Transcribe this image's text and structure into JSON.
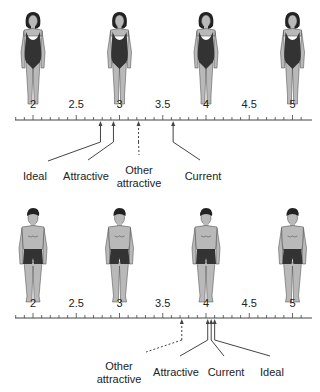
{
  "scale": {
    "min": 1.8,
    "max": 5.1,
    "major_labels": [
      "2",
      "2.5",
      "3",
      "3.5",
      "4",
      "4.5",
      "5"
    ],
    "major_values": [
      2,
      2.5,
      3,
      3.5,
      4,
      4.5,
      5
    ],
    "tick_step": 0.1,
    "px_at_2": 33,
    "px_per_unit": 86.5
  },
  "colors": {
    "skin": "#b9b9b9",
    "swimsuit": "#333333",
    "hair": "#222222",
    "line": "#444444",
    "text": "#222222"
  },
  "panels": [
    {
      "id": "women",
      "figure_type": "female",
      "figure_values": [
        2,
        3,
        4,
        5
      ],
      "axis_y": 120,
      "label_y": 108,
      "markers": [
        {
          "label_lines": [
            "Ideal"
          ],
          "value": 2.78,
          "dashed": false,
          "label_x": 35,
          "label_y": 172,
          "bend_x": 48,
          "bend_y": 163,
          "anchor": "middle"
        },
        {
          "label_lines": [
            "Attractive"
          ],
          "value": 2.93,
          "dashed": false,
          "label_x": 86,
          "label_y": 172,
          "bend_x": 88,
          "bend_y": 162,
          "anchor": "middle"
        },
        {
          "label_lines": [
            "Other",
            "attractive"
          ],
          "value": 3.22,
          "dashed": true,
          "label_x": 139,
          "label_y": 166,
          "bend_x": 139,
          "bend_y": 157,
          "anchor": "middle"
        },
        {
          "label_lines": [
            "Current"
          ],
          "value": 3.62,
          "dashed": false,
          "label_x": 203,
          "label_y": 172,
          "bend_x": 200,
          "bend_y": 162,
          "anchor": "middle"
        }
      ]
    },
    {
      "id": "men",
      "figure_type": "male",
      "figure_values": [
        2,
        3,
        4,
        5
      ],
      "axis_y": 122,
      "label_y": 111,
      "markers": [
        {
          "label_lines": [
            "Other",
            "attractive"
          ],
          "value": 3.72,
          "dashed": true,
          "label_x": 119,
          "label_y": 166,
          "bend_x": 146,
          "bend_y": 158,
          "anchor": "middle"
        },
        {
          "label_lines": [
            "Attractive"
          ],
          "value": 4.02,
          "dashed": false,
          "label_x": 176,
          "label_y": 172,
          "bend_x": 180,
          "bend_y": 162,
          "anchor": "middle"
        },
        {
          "label_lines": [
            "Current"
          ],
          "value": 4.06,
          "dashed": false,
          "label_x": 226,
          "label_y": 172,
          "bend_x": 224,
          "bend_y": 162,
          "anchor": "middle"
        },
        {
          "label_lines": [
            "Ideal"
          ],
          "value": 4.1,
          "dashed": false,
          "label_x": 272,
          "label_y": 172,
          "bend_x": 270,
          "bend_y": 162,
          "anchor": "middle"
        }
      ]
    }
  ]
}
